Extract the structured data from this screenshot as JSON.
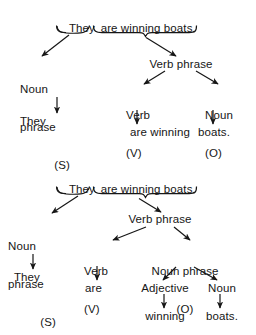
{
  "page": {
    "background_color": "#ffffff",
    "ink_color": "#161616"
  },
  "diagrams": [
    {
      "id": "diagram-1",
      "sentence": "They are winning boats.",
      "sentence_parts": [
        "They",
        "are winning boats."
      ],
      "nodes": {
        "noun_phrase": "Noun",
        "noun_phrase_2": "phrase",
        "noun_phrase_label": "(S)",
        "noun_phrase_word": "They",
        "verb_phrase": "Verb phrase",
        "verb": "Verb",
        "verb_label": "(V)",
        "verb_words": "are winning",
        "noun": "Noun",
        "noun_label": "(O)",
        "noun_word": "boats."
      }
    },
    {
      "id": "diagram-2",
      "sentence": "They are winning boats.",
      "sentence_parts": [
        "They",
        "are winning boats."
      ],
      "nodes": {
        "noun_phrase": "Noun",
        "noun_phrase_2": "phrase",
        "noun_phrase_label": "(S)",
        "noun_phrase_word": "They",
        "verb_phrase": "Verb phrase",
        "verb": "Verb",
        "verb_label": "(V)",
        "verb_word": "are",
        "object_np": "Noun phrase",
        "object_np_label": "(O)",
        "adjective": "Adjective",
        "adjective_word": "winning",
        "noun": "Noun",
        "noun_word": "boats."
      }
    }
  ]
}
